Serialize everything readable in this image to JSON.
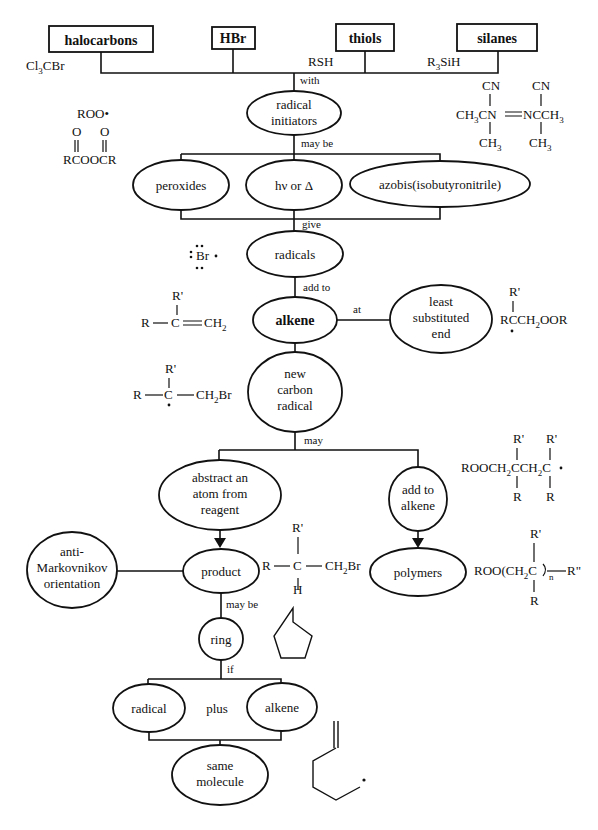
{
  "reagents": [
    {
      "label": "halocarbons",
      "example": "Cl3CBr"
    },
    {
      "label": "HBr",
      "example": ""
    },
    {
      "label": "thiols",
      "example": "RSH"
    },
    {
      "label": "silanes",
      "example": "R3SiH"
    }
  ],
  "links": {
    "with": "with",
    "may_be": "may be",
    "give": "give",
    "add_to": "add to",
    "at": "at",
    "may": "may",
    "product_may_be": "may be",
    "if": "if",
    "plus": "plus"
  },
  "nodes": {
    "radical_initiators": [
      "radical",
      "initiators"
    ],
    "peroxides": "peroxides",
    "hv_or_delta": "hν or Δ",
    "azobis": "azobis(isobutyronitrile)",
    "radicals": "radicals",
    "alkene": "alkene",
    "least_substituted_end": [
      "least",
      "substituted",
      "end"
    ],
    "new_carbon_radical": [
      "new",
      "carbon",
      "radical"
    ],
    "abstract_atom": [
      "abstract an",
      "atom from",
      "reagent"
    ],
    "add_to_alkene": [
      "add to",
      "alkene"
    ],
    "product": "product",
    "polymers": "polymers",
    "anti_markovnikov": [
      "anti-",
      "Markovnikov",
      "orientation"
    ],
    "ring": "ring",
    "radical": "radical",
    "alkene2": "alkene",
    "same_molecule": [
      "same",
      "molecule"
    ]
  },
  "structures": {
    "roo_radical": "ROO•",
    "peroxide": {
      "top": "O      O",
      "bottom": "RCOOCR"
    },
    "aibn": {
      "cn": "CN",
      "left": "CH3CN",
      "right": "NCCH3",
      "ch3": "CH3"
    },
    "br_radical": "Br",
    "alkene_struct": {
      "r": "R",
      "rp": "R'",
      "c": "C",
      "ch2": "CH2"
    },
    "adduct_radical": {
      "rp": "R'",
      "main": "RCCH2OOR"
    },
    "bromo_radical": {
      "r": "R",
      "rp": "R'",
      "c": "C",
      "ch2br": "CH2Br"
    },
    "dimer_radical": {
      "rp": "R'",
      "main": "ROOCH2CCH2C",
      "r": "R"
    },
    "polymer": {
      "rp": "R'",
      "main": "ROO(CH2C",
      "n": "n",
      "rpp": "R\"",
      "r": "R"
    },
    "product_struct": {
      "r": "R",
      "rp": "R'",
      "c": "C",
      "ch2br": "CH2Br",
      "h": "H"
    }
  }
}
